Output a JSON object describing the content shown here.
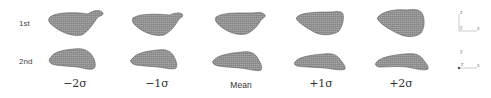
{
  "figure": {
    "rows": [
      {
        "label": "1st"
      },
      {
        "label": "2nd"
      }
    ],
    "columns": [
      {
        "label": "−2σ"
      },
      {
        "label": "−1σ"
      },
      {
        "label": "Mean"
      },
      {
        "label": "+1σ"
      },
      {
        "label": "+2σ"
      }
    ],
    "axes": {
      "top": {
        "vertical": "z",
        "origin": "y",
        "horizontal": "x"
      },
      "bottom": {
        "vertical": "y",
        "origin": "z",
        "horizontal": "x"
      }
    },
    "colors": {
      "shape_fill": "#8a8a8a",
      "shape_edge": "#5a5a5a",
      "axis_line": "#999999"
    }
  }
}
